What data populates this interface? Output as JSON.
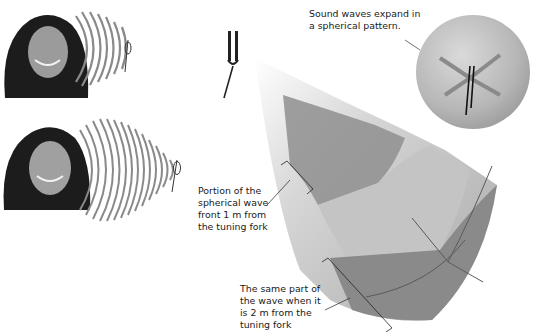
{
  "figure": {
    "type": "diagram",
    "colors": {
      "cone_light": "#d8d8d8",
      "cone_mid": "#b5b5b5",
      "cone_dark": "#8f8f8f",
      "band_dark": "#7c7c7c",
      "sphere": "#b9b9b9",
      "wave_ring": "#8a8a8a",
      "fork": "#222222",
      "text": "#1a1a1a"
    }
  },
  "panels": {
    "top_left": {
      "description": "Girl smiling while hearing a tuning fork at close range",
      "wave_rings": 8
    },
    "bottom_left": {
      "description": "Girl smiling while hearing a tuning fork with more wave fronts",
      "wave_rings": 14
    }
  },
  "labels": {
    "sphere_caption": [
      "Sound waves expand in",
      "a spherical pattern."
    ],
    "portion_1m": [
      "Portion of the",
      "spherical wave",
      "front 1 m from",
      "the tuning fork"
    ],
    "portion_2m": [
      "The same part of",
      "the wave when it",
      "is 2 m from the",
      "tuning fork"
    ]
  }
}
